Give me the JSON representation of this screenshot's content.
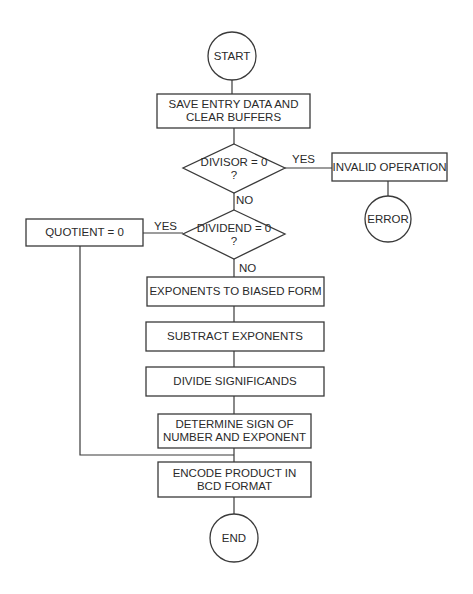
{
  "diagram": {
    "type": "flowchart",
    "line_color": "#3a3a3a",
    "text_color": "#2a2a2a",
    "nodes": {
      "start": {
        "shape": "circle",
        "label": "START"
      },
      "save": {
        "shape": "process",
        "label": "SAVE ENTRY DATA AND\nCLEAR BUFFERS"
      },
      "divisor": {
        "shape": "decision",
        "label": "DIVISOR = 0\n?"
      },
      "invalid": {
        "shape": "process",
        "label": "INVALID OPERATION"
      },
      "error": {
        "shape": "circle",
        "label": "ERROR"
      },
      "dividend": {
        "shape": "decision",
        "label": "DIVIDEND = 0\n?"
      },
      "quotient": {
        "shape": "process",
        "label": "QUOTIENT = 0"
      },
      "exponents": {
        "shape": "process",
        "label": "EXPONENTS TO BIASED FORM"
      },
      "subtract": {
        "shape": "process",
        "label": "SUBTRACT EXPONENTS"
      },
      "divide": {
        "shape": "process",
        "label": "DIVIDE SIGNIFICANDS"
      },
      "determine": {
        "shape": "process",
        "label": "DETERMINE SIGN OF\nNUMBER AND EXPONENT"
      },
      "encode": {
        "shape": "process",
        "label": "ENCODE PRODUCT IN\nBCD FORMAT"
      },
      "end": {
        "shape": "circle",
        "label": "END"
      }
    },
    "edges": {
      "divisor_yes": "YES",
      "divisor_no": "NO",
      "dividend_yes": "YES",
      "dividend_no": "NO"
    }
  }
}
